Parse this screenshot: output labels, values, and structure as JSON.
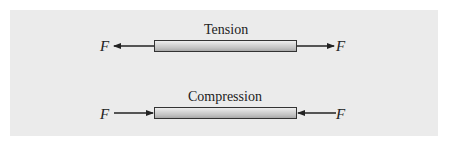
{
  "diagram": {
    "tension": {
      "title": "Tension",
      "left_force": "F",
      "right_force": "F"
    },
    "compression": {
      "title": "Compression",
      "left_force": "F",
      "right_force": "F"
    },
    "colors": {
      "panel": "#ebebeb",
      "bar_light": "#eeeeee",
      "bar_dark": "#a8a8a8",
      "line": "#222222"
    }
  }
}
